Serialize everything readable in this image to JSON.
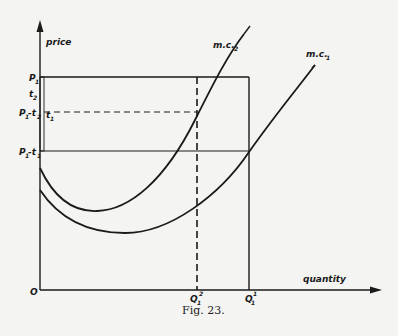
{
  "figure": {
    "caption": "Fig. 23.",
    "axes": {
      "y_label": "price",
      "x_label": "quantity",
      "origin_label": "O"
    },
    "curves": [
      {
        "id": "mc2",
        "label": "m.c.",
        "subscript": "2"
      },
      {
        "id": "mc1",
        "label": "m.c.",
        "subscript": "1"
      }
    ],
    "price_labels": {
      "p1": {
        "main": "P",
        "sub": "1"
      },
      "t2": {
        "main": "t",
        "sub": "2"
      },
      "p1_minus_t2": {
        "main": "P",
        "sub": "1",
        "rest": "-t",
        "rest_sub": "2"
      },
      "t1": {
        "main": "t",
        "sub": "1"
      },
      "p1_minus_t1": {
        "main": "P",
        "sub": "1",
        "rest": "-t",
        "rest_sub": "1"
      }
    },
    "quantity_labels": {
      "q1_2": {
        "main": "Q",
        "sub": "1",
        "sup": "2"
      },
      "q1_1": {
        "main": "Q",
        "sub": "1",
        "sup": "1"
      }
    }
  },
  "colors": {
    "ink": "#1a1a1a",
    "paper": "#f4f4f2"
  }
}
